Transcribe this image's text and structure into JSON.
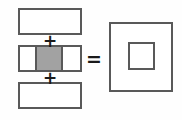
{
  "diagram": {
    "background_color": "#fefefe",
    "stroke_color": "#595959",
    "fill_color": "#a2a2a2",
    "white_color": "#ffffff",
    "left_side": {
      "label": "sum of three horizontal bands",
      "bands": [
        {
          "name": "top-band",
          "label": "",
          "fill": "white",
          "segments": 1
        },
        {
          "name": "middle-band",
          "label": "",
          "fill": "mixed",
          "segments": 3,
          "segment_fills": [
            "white",
            "gray",
            "white"
          ]
        },
        {
          "name": "bottom-band",
          "label": "",
          "fill": "white",
          "segments": 1
        }
      ],
      "operators": [
        {
          "name": "plus-1",
          "symbol": "+"
        },
        {
          "name": "plus-2",
          "symbol": "+"
        }
      ]
    },
    "relation": {
      "name": "equals",
      "symbol": "="
    },
    "right_side": {
      "label": "square with concentric inner square",
      "outer": {
        "name": "outer-square",
        "fill": "white"
      },
      "inner": {
        "name": "inner-square",
        "fill": "white"
      }
    }
  }
}
